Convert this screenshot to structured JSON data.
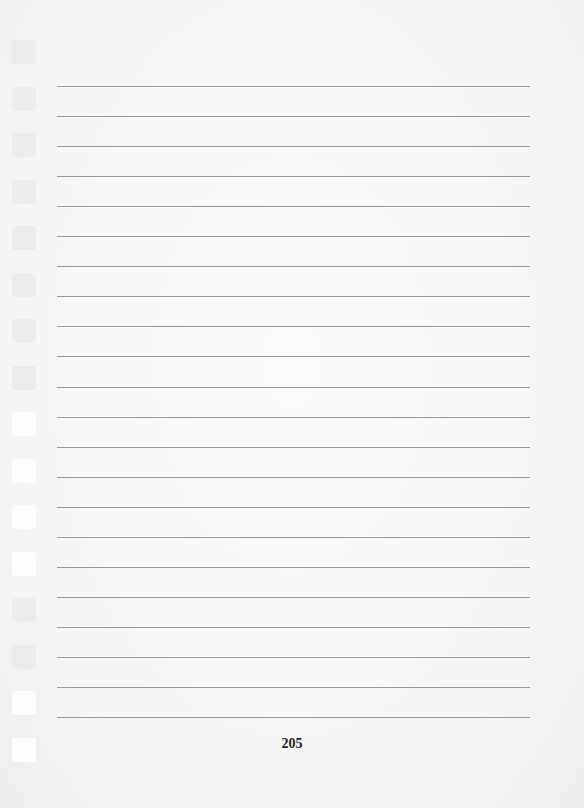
{
  "page": {
    "page_number": "205",
    "line_count": 22,
    "hole_count": 16,
    "colors": {
      "paper": "#f6f6f5",
      "rule": "#9a9a9a",
      "hole": "#ececeb",
      "text": "#222222"
    }
  }
}
